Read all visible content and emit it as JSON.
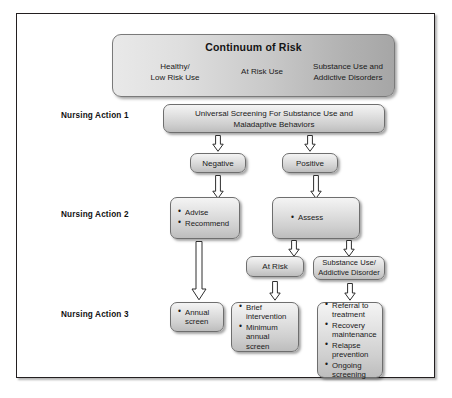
{
  "diagram": {
    "banner": {
      "title": "Continuum of Risk",
      "columns": [
        {
          "line1": "Healthy/",
          "line2": "Low Risk Use"
        },
        {
          "line1": "At Risk Use",
          "line2": ""
        },
        {
          "line1": "Substance Use and",
          "line2": "Addictive Disorders"
        }
      ]
    },
    "action_labels": {
      "action1": "Nursing Action 1",
      "action2": "Nursing Action 2",
      "action3": "Nursing Action 3"
    },
    "nodes": {
      "screening": {
        "line1": "Universal Screening For Substance Use and",
        "line2": "Maladaptive Behaviors"
      },
      "negative": {
        "label": "Negative"
      },
      "positive": {
        "label": "Positive"
      },
      "advise": {
        "items": [
          "Advise",
          "Recommend"
        ]
      },
      "assess": {
        "items": [
          "Assess"
        ]
      },
      "at_risk": {
        "label": "At Risk"
      },
      "substance_use": {
        "line1": "Substance Use/",
        "line2": "Addictive Disorder"
      },
      "annual_screen": {
        "items": [
          "Annual screen"
        ]
      },
      "brief": {
        "items": [
          "Brief intervention",
          "Minimum annual screen"
        ]
      },
      "treatment": {
        "items": [
          "Referral to treatment",
          "Recovery maintenance",
          "Relapse prevention",
          "Ongoing screening"
        ]
      }
    },
    "arrows": [
      {
        "name": "arrow-screening-to-negative",
        "from": "screening",
        "to": "negative"
      },
      {
        "name": "arrow-screening-to-positive",
        "from": "screening",
        "to": "positive"
      },
      {
        "name": "arrow-negative-to-advise",
        "from": "negative",
        "to": "advise"
      },
      {
        "name": "arrow-positive-to-assess",
        "from": "positive",
        "to": "assess"
      },
      {
        "name": "arrow-assess-to-at-risk",
        "from": "assess",
        "to": "at_risk"
      },
      {
        "name": "arrow-assess-to-substance-use",
        "from": "assess",
        "to": "substance_use"
      },
      {
        "name": "arrow-advise-to-annual-screen",
        "from": "advise",
        "to": "annual_screen"
      },
      {
        "name": "arrow-at-risk-to-brief",
        "from": "at_risk",
        "to": "brief"
      },
      {
        "name": "arrow-substance-use-to-treatment",
        "from": "substance_use",
        "to": "treatment"
      }
    ],
    "colors": {
      "frame_border": "#231f20",
      "node_border": "#6e6e6e",
      "node_fill_light": "#f4f4f4",
      "node_fill_dark": "#bdbdbd",
      "banner_fill_left": "#e9e9e9",
      "banner_fill_right": "#a6a6a6",
      "arrow_stroke": "#2e2e2e",
      "text": "#1a1a1a"
    }
  }
}
